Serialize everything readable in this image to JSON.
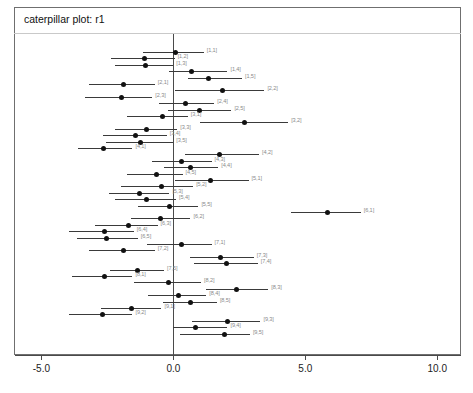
{
  "window": {
    "title": "caterpillar plot: r1"
  },
  "chart_data": {
    "type": "scatter",
    "title": "caterpillar plot: r1",
    "xlabel": "",
    "ylabel": "",
    "xlim": [
      -6.0,
      10.9
    ],
    "xticks": [
      -5.0,
      0.0,
      5.0,
      10.0
    ],
    "xticklabels": [
      "-5.0",
      "0.0",
      "5.0",
      "10.0"
    ],
    "grid": false,
    "legend": null,
    "reference_line_x": 0.0,
    "orientation": "horizontal-intervals",
    "columns": [
      "label",
      "lower",
      "mean",
      "upper"
    ],
    "rows": [
      {
        "label": "[1,1]",
        "lower": -1.15,
        "mean": 0.1,
        "upper": 1.15
      },
      {
        "label": "[1,2]",
        "lower": -2.35,
        "mean": -1.1,
        "upper": 0.05
      },
      {
        "label": "[1,3]",
        "lower": -2.2,
        "mean": -1.05,
        "upper": 0.0
      },
      {
        "label": "[1,4]",
        "lower": -0.15,
        "mean": 0.7,
        "upper": 2.05
      },
      {
        "label": "[1,5]",
        "lower": 0.55,
        "mean": 1.35,
        "upper": 2.6
      },
      {
        "label": "[2,1]",
        "lower": -3.2,
        "mean": -1.9,
        "upper": -0.7
      },
      {
        "label": "[2,2]",
        "lower": 0.05,
        "mean": 1.85,
        "upper": 3.45
      },
      {
        "label": "[2,3]",
        "lower": -3.35,
        "mean": -1.95,
        "upper": -0.8
      },
      {
        "label": "[2,4]",
        "lower": -0.55,
        "mean": 0.45,
        "upper": 1.55
      },
      {
        "label": "[2,5]",
        "lower": -0.2,
        "mean": 1.0,
        "upper": 2.2
      },
      {
        "label": "[3,1]",
        "lower": -1.75,
        "mean": -0.4,
        "upper": 0.55
      },
      {
        "label": "[3,2]",
        "lower": 1.0,
        "mean": 2.7,
        "upper": 4.35
      },
      {
        "label": "[3,3]",
        "lower": -2.2,
        "mean": -1.0,
        "upper": 0.15
      },
      {
        "label": "[3,4]",
        "lower": -2.65,
        "mean": -1.45,
        "upper": -0.25
      },
      {
        "label": "[3,5]",
        "lower": -2.55,
        "mean": -1.25,
        "upper": 0.0
      },
      {
        "label": "[4,1]",
        "lower": -3.6,
        "mean": -2.65,
        "upper": -1.55
      },
      {
        "label": "[4,2]",
        "lower": 0.45,
        "mean": 1.75,
        "upper": 3.25
      },
      {
        "label": "[4,3]",
        "lower": -0.8,
        "mean": 0.3,
        "upper": 1.45
      },
      {
        "label": "[4,4]",
        "lower": -0.35,
        "mean": 0.65,
        "upper": 1.7
      },
      {
        "label": "[4,5]",
        "lower": -1.75,
        "mean": -0.65,
        "upper": 0.35
      },
      {
        "label": "[5,1]",
        "lower": 0.05,
        "mean": 1.4,
        "upper": 2.85
      },
      {
        "label": "[5,2]",
        "lower": -2.0,
        "mean": -0.45,
        "upper": 0.75
      },
      {
        "label": "[5,3]",
        "lower": -2.45,
        "mean": -1.3,
        "upper": -0.15
      },
      {
        "label": "[5,4]",
        "lower": -2.2,
        "mean": -1.0,
        "upper": 0.1
      },
      {
        "label": "[5,5]",
        "lower": -1.35,
        "mean": -0.15,
        "upper": 0.95
      },
      {
        "label": "[6,1]",
        "lower": 4.45,
        "mean": 5.85,
        "upper": 7.1
      },
      {
        "label": "[6,2]",
        "lower": -1.6,
        "mean": -0.5,
        "upper": 0.65
      },
      {
        "label": "[6,3]",
        "lower": -2.95,
        "mean": -1.7,
        "upper": -0.6
      },
      {
        "label": "[6,4]",
        "lower": -3.95,
        "mean": -2.6,
        "upper": -1.5
      },
      {
        "label": "[6,5]",
        "lower": -3.65,
        "mean": -2.55,
        "upper": -1.35
      },
      {
        "label": "[7,1]",
        "lower": -1.0,
        "mean": 0.3,
        "upper": 1.45
      },
      {
        "label": "[7,2]",
        "lower": -3.2,
        "mean": -1.9,
        "upper": -0.7
      },
      {
        "label": "[7,3]",
        "lower": 0.65,
        "mean": 1.8,
        "upper": 3.05
      },
      {
        "label": "[7,4]",
        "lower": 0.8,
        "mean": 2.0,
        "upper": 3.2
      },
      {
        "label": "[7,5]",
        "lower": -2.4,
        "mean": -1.35,
        "upper": -0.35
      },
      {
        "label": "[8,1]",
        "lower": -3.85,
        "mean": -2.6,
        "upper": -1.55
      },
      {
        "label": "[8,2]",
        "lower": -1.5,
        "mean": -0.2,
        "upper": 1.05
      },
      {
        "label": "[8,3]",
        "lower": 1.25,
        "mean": 2.4,
        "upper": 3.6
      },
      {
        "label": "[8,4]",
        "lower": -0.95,
        "mean": 0.2,
        "upper": 1.25
      },
      {
        "label": "[8,5]",
        "lower": -0.4,
        "mean": 0.65,
        "upper": 1.65
      },
      {
        "label": "[9,1]",
        "lower": -2.75,
        "mean": -1.6,
        "upper": -0.45
      },
      {
        "label": "[9,2]",
        "lower": -3.95,
        "mean": -2.7,
        "upper": -1.55
      },
      {
        "label": "[9,3]",
        "lower": 0.7,
        "mean": 2.05,
        "upper": 3.3
      },
      {
        "label": "[9,4]",
        "lower": 0.0,
        "mean": 0.85,
        "upper": 2.05
      },
      {
        "label": "[9,5]",
        "lower": 0.25,
        "mean": 1.95,
        "upper": 2.9
      }
    ]
  }
}
